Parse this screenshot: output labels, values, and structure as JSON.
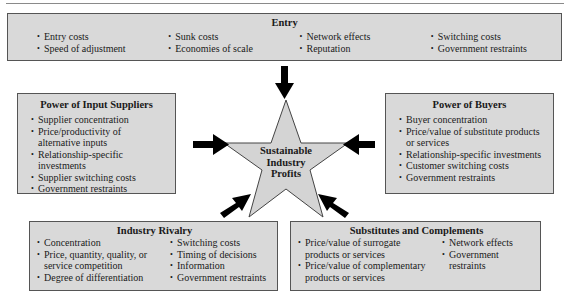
{
  "diagram": {
    "center": {
      "label_lines": [
        "Sustainable",
        "Industry",
        "Profits"
      ]
    },
    "entry": {
      "title": "Entry",
      "columns": [
        [
          "Entry costs",
          "Speed of adjustment"
        ],
        [
          "Sunk costs",
          "Economies of scale"
        ],
        [
          "Network effects",
          "Reputation"
        ],
        [
          "Switching costs",
          "Government restraints"
        ]
      ]
    },
    "suppliers": {
      "title": "Power of Input Suppliers",
      "items": [
        "Supplier concentration",
        "Price/productivity of alternative inputs",
        "Relationship-specific investments",
        "Supplier switching costs",
        "Government restraints"
      ]
    },
    "buyers": {
      "title": "Power of Buyers",
      "items": [
        "Buyer concentration",
        "Price/value of substitute products or services",
        "Relationship-specific investments",
        "Customer switching costs",
        "Government restraints"
      ]
    },
    "rivalry": {
      "title": "Industry Rivalry",
      "columns": [
        [
          "Concentration",
          "Price, quantity, quality, or service competition",
          "Degree of differentiation"
        ],
        [
          "Switching costs",
          "Timing of decisions",
          "Information",
          "Government restraints"
        ]
      ]
    },
    "substitutes": {
      "title": "Substitutes and Complements",
      "columns": [
        [
          "Price/value of surrogate products or services",
          "Price/value of complementary products or services"
        ],
        [
          "Network effects",
          "Government restraints"
        ]
      ]
    },
    "colors": {
      "box_fill": "#d9d9d9",
      "star_fill": "#d4d4d4",
      "arrow": "#000000"
    }
  }
}
